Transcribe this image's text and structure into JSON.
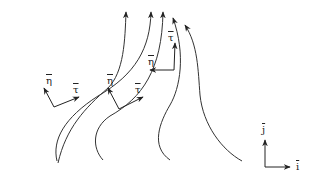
{
  "diagram": {
    "stroke_color": "#333333",
    "streamlines": [
      {
        "id": 1,
        "path": "M60,162 C70,120 95,95 110,70 C120,50 125,30 125,12"
      },
      {
        "id": 2,
        "path": "M57,161 C55,135 70,105 120,80 C145,60 150,35 150,12"
      },
      {
        "id": 3,
        "path": "M104,160 C95,140 95,110 145,85 C160,65 163,40 163,12"
      },
      {
        "id": 4,
        "path": "M170,160 C150,140 170,110 180,80 C185,60 183,35 176,17"
      },
      {
        "id": 5,
        "path": "M245,161 C200,140 200,90 200,60 C200,40 198,30 183,26"
      },
      {
        "id": 6,
        "path": "M199,160 C180,140 198,110 198,80"
      }
    ],
    "vector_groups": [
      {
        "id": "A",
        "tangent_label": "τ",
        "normal_label": "η",
        "origin": [
          54,
          108
        ],
        "tangent_tip": [
          78,
          97
        ],
        "normal_tip": [
          44,
          89
        ]
      },
      {
        "id": "B",
        "tangent_label": "τ",
        "normal_label": "η",
        "origin": [
          119,
          109
        ],
        "tangent_tip": [
          143,
          97
        ],
        "normal_tip": [
          108,
          89
        ]
      },
      {
        "id": "C",
        "tangent_label": "τ",
        "normal_label": "η",
        "origin": [
          174,
          71
        ],
        "tangent_tip": [
          175,
          44
        ],
        "normal_tip": [
          150,
          71
        ]
      }
    ],
    "axes": {
      "origin": [
        263,
        167
      ],
      "j_tip": [
        263,
        142
      ],
      "i_tip": [
        289,
        167
      ],
      "i_label": "i",
      "j_label": "j"
    }
  },
  "labels": {
    "eta_1": "η",
    "tau_1": "τ",
    "eta_2": "η",
    "tau_2": "τ",
    "eta_3": "η",
    "tau_3": "τ",
    "axis_j": "j",
    "axis_i": "i"
  }
}
